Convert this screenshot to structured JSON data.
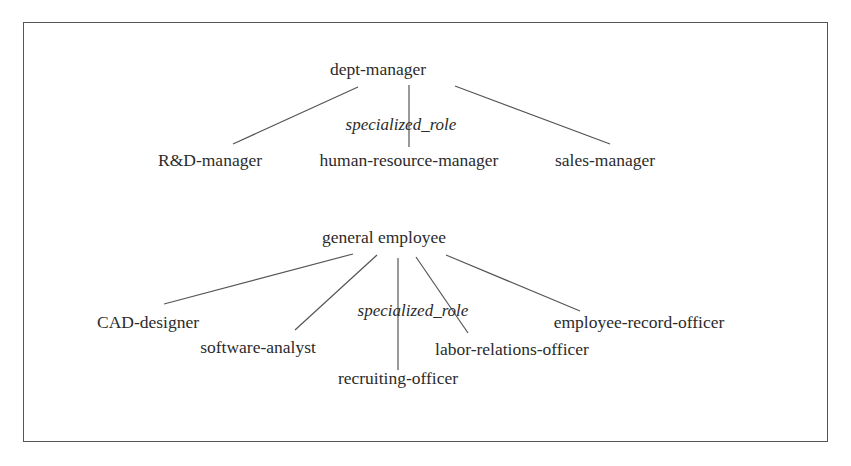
{
  "diagram": {
    "trees": [
      {
        "root": "dept-manager",
        "relation_label": "specialized_role",
        "children": [
          "R&D-manager",
          "human-resource-manager",
          "sales-manager"
        ]
      },
      {
        "root": "general employee",
        "relation_label": "specialized_role",
        "children": [
          "CAD-designer",
          "software-analyst",
          "recruiting-officer",
          "labor-relations-officer",
          "employee-record-officer"
        ]
      }
    ]
  }
}
